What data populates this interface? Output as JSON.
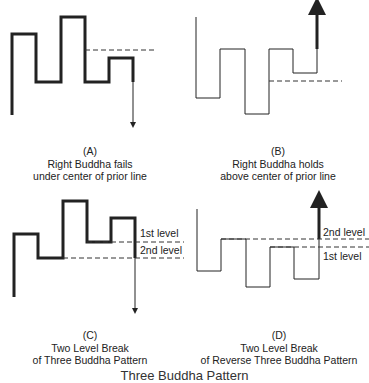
{
  "panels": [
    {
      "id": "A",
      "letter": "(A)",
      "line1": "Right Buddha fails",
      "line2": "under center of prior line"
    },
    {
      "id": "B",
      "letter": "(B)",
      "line1": "Right Buddha holds",
      "line2": "above center of prior line"
    },
    {
      "id": "C",
      "letter": "(C)",
      "line1": "Two Level Break",
      "line2": "of Three Buddha Pattern",
      "levels": {
        "first": "1st level",
        "second": "2nd level"
      }
    },
    {
      "id": "D",
      "letter": "(D)",
      "line1": "Two Level Break",
      "line2": "of Reverse Three Buddha Pattern",
      "levels": {
        "first": "1st level",
        "second": "2nd level"
      }
    }
  ],
  "footer": {
    "partial_title": "Three Buddha Pattern"
  },
  "colors": {
    "line": "#222222",
    "dash": "#333333",
    "background": "#ffffff"
  }
}
